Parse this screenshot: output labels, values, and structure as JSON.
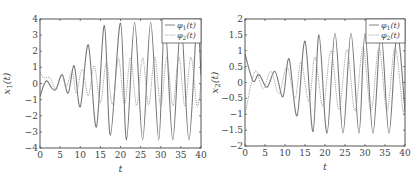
{
  "chart_data": [
    {
      "type": "line",
      "title": "",
      "xlabel": "t",
      "ylabel": "x_1(t)",
      "xlim": [
        0,
        40
      ],
      "ylim": [
        -4,
        4
      ],
      "xticks": [
        0,
        5,
        10,
        15,
        20,
        25,
        30,
        35,
        40
      ],
      "yticks": [
        -4,
        -3,
        -2,
        -1,
        0,
        1,
        2,
        3,
        4
      ],
      "grid": false,
      "legend_position": "upper right",
      "series": [
        {
          "name": "φ1(t)",
          "style": "solid",
          "color": "#777777",
          "x": [
            0,
            1.5,
            3,
            4,
            5.5,
            7,
            8.5,
            10,
            12,
            14,
            16,
            17.5,
            20,
            21.5,
            23.5,
            25.5,
            27.5,
            29.5,
            31,
            33,
            35,
            37,
            39,
            40
          ],
          "values": [
            -0.8,
            0.15,
            -0.3,
            -0.35,
            0.55,
            -0.6,
            1.1,
            -1.45,
            2.4,
            -2.7,
            3.6,
            -3.2,
            3.75,
            -3.5,
            3.8,
            -3.5,
            3.8,
            -3.5,
            3.8,
            -3.5,
            3.8,
            -3.5,
            3.8,
            0.5
          ]
        },
        {
          "name": "φ2(t)",
          "style": "dotted",
          "color": "#999999",
          "x": [
            0,
            1,
            2.5,
            4,
            5.5,
            6.5,
            8,
            9,
            10.5,
            12,
            13.5,
            15,
            16.5,
            18,
            19.5,
            21,
            22.5,
            24,
            25.5,
            27,
            28.5,
            30,
            31.5,
            33,
            34.5,
            36,
            37.5,
            39,
            40
          ],
          "values": [
            0.7,
            0.35,
            0.35,
            -0.35,
            0.55,
            -0.2,
            0.75,
            -0.6,
            0.9,
            -0.75,
            1.1,
            -1.2,
            1.3,
            -1.3,
            1.55,
            -1.3,
            1.6,
            -1.35,
            1.6,
            -1.35,
            1.65,
            -1.4,
            1.65,
            -1.4,
            1.65,
            -1.4,
            1.65,
            -1.4,
            0.0
          ]
        }
      ]
    },
    {
      "type": "line",
      "title": "",
      "xlabel": "t",
      "ylabel": "x_2(t)",
      "xlim": [
        0,
        40
      ],
      "ylim": [
        -2,
        2
      ],
      "xticks": [
        0,
        5,
        10,
        15,
        20,
        25,
        30,
        35,
        40
      ],
      "yticks": [
        -2,
        -1.5,
        -1,
        -0.5,
        0,
        0.5,
        1,
        1.5,
        2
      ],
      "grid": false,
      "legend_position": "upper right",
      "series": [
        {
          "name": "φ1(t)",
          "style": "solid",
          "color": "#777777",
          "x": [
            0,
            2,
            3.5,
            5.5,
            7.5,
            9.5,
            11,
            13,
            15,
            17,
            18.5,
            20.5,
            22.5,
            24.5,
            26.5,
            28.5,
            30,
            32,
            34,
            36,
            38,
            40
          ],
          "values": [
            0.9,
            0.05,
            0.25,
            -0.15,
            0.35,
            -0.45,
            0.75,
            -1.05,
            1.3,
            -1.55,
            1.5,
            -1.6,
            1.55,
            -1.6,
            1.55,
            -1.6,
            1.55,
            -1.6,
            1.55,
            -1.6,
            1.55,
            -0.9
          ]
        },
        {
          "name": "φ2(t)",
          "style": "dotted",
          "color": "#999999",
          "x": [
            0,
            2.5,
            4.5,
            6.5,
            8.5,
            10.5,
            12.5,
            14,
            16,
            17.5,
            19.5,
            21.5,
            23.5,
            25.5,
            27.5,
            29.5,
            31.5,
            33.5,
            35.5,
            37.5,
            39.5,
            40
          ],
          "values": [
            -1.0,
            0.35,
            -0.2,
            0.35,
            -0.35,
            0.5,
            -0.5,
            0.65,
            -0.6,
            0.8,
            -0.75,
            1.0,
            -0.85,
            1.05,
            -0.9,
            1.1,
            -0.9,
            1.1,
            -0.9,
            1.1,
            -0.9,
            -0.5
          ]
        }
      ]
    }
  ],
  "plots": [
    {
      "ylabel_main": "x",
      "ylabel_sub": "1",
      "ylabel_suffix": "(t)",
      "xlabel": "t",
      "xtick_labels": [
        "0",
        "5",
        "10",
        "15",
        "20",
        "25",
        "30",
        "35",
        "40"
      ],
      "ytick_labels": [
        "4",
        "3",
        "2",
        "1",
        "0",
        "−1",
        "−2",
        "−3",
        "−4"
      ],
      "legend": [
        {
          "main": "φ",
          "sub": "1",
          "suffix": "(t)"
        },
        {
          "main": "φ",
          "sub": "2",
          "suffix": "(t)"
        }
      ]
    },
    {
      "ylabel_main": "x",
      "ylabel_sub": "2",
      "ylabel_suffix": "(t)",
      "xlabel": "t",
      "xtick_labels": [
        "0",
        "5",
        "10",
        "15",
        "20",
        "25",
        "30",
        "35",
        "40"
      ],
      "ytick_labels": [
        "2",
        "1.5",
        "1",
        "0.5",
        "0",
        "−0.5",
        "−1",
        "−1.5",
        "−2"
      ],
      "legend": [
        {
          "main": "φ",
          "sub": "1",
          "suffix": "(t)"
        },
        {
          "main": "φ",
          "sub": "2",
          "suffix": "(t)"
        }
      ]
    }
  ],
  "colors": {
    "frame": "#555555",
    "series1": "#777777",
    "series2": "#999999",
    "text": "#444444"
  }
}
